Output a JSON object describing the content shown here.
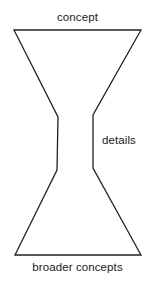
{
  "figure": {
    "type": "hourglass-diagram",
    "shape_name": "hourglass-outline",
    "stroke_color": "#222222",
    "fill_color": "none",
    "background_color": "#ffffff",
    "stroke_width": 1.3,
    "outline_points": "14,30 141,30 93,115 93,168 141,255 15,255 57,170 58,117",
    "labels": {
      "top": "concept",
      "right": "details",
      "bottom": "broader concepts"
    }
  }
}
